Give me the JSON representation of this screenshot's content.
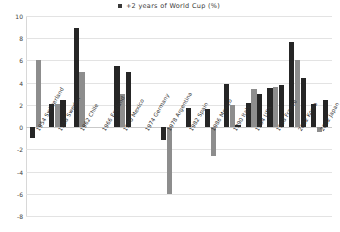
{
  "legend": {
    "marker": "square-marker-icon",
    "label": "+2 years of World Cup (%)",
    "color": "#3a3a3a"
  },
  "colors": {
    "series_dark": "#262626",
    "series_gray": "#8d8d8d",
    "grid": "#e3e3e3",
    "background": "#ffffff"
  },
  "chart_data": {
    "type": "bar",
    "title": "+2 years of World Cup (%)",
    "xlabel": "",
    "ylabel": "",
    "ylim": [
      -8,
      10
    ],
    "yticks": [
      10,
      8,
      6,
      4,
      2,
      0,
      -2,
      -4,
      -6,
      -8
    ],
    "ytick_labels": [
      "10",
      "8",
      "6",
      "4",
      "2",
      "0",
      "-2",
      "-4",
      "-6",
      "-8"
    ],
    "grid": true,
    "legend_position": "top-center",
    "categories": [
      "1954 Switzerland",
      "1958 Sweden",
      "1962 Chile",
      "1966 England",
      "1970 Mexico",
      "1974 Germany",
      "1978 Argentina",
      "1982 Spain",
      "1986 Mexico",
      "1990 Italy",
      "1994 USA",
      "1998 France",
      "2002 Korea",
      "2002 Japan"
    ],
    "series": [
      {
        "name": "bar-1",
        "color": "#262626",
        "values": [
          -1.0,
          2.1,
          8.9,
          null,
          5.5,
          null,
          -1.2,
          1.7,
          1.6,
          3.85,
          2.2,
          3.5,
          7.7,
          2.05
        ]
      },
      {
        "name": "bar-2",
        "color": "#8d8d8d",
        "values": [
          6.0,
          2.05,
          5.0,
          null,
          3.0,
          null,
          -6.0,
          null,
          -2.6,
          1.95,
          3.4,
          3.6,
          6.0,
          -0.4
        ]
      },
      {
        "name": "bar-3",
        "color": "#262626",
        "values": [
          null,
          2.4,
          null,
          null,
          5.0,
          null,
          null,
          null,
          null,
          0.15,
          2.95,
          3.8,
          4.4,
          2.4
        ]
      }
    ]
  }
}
